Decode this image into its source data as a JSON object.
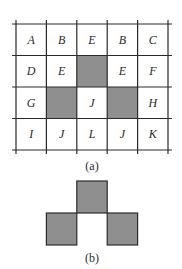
{
  "figure_a": {
    "caption": "(a)",
    "columns": 5,
    "rows": 4,
    "grid_x": [
      16,
      46.4,
      76.8,
      107.2,
      137.6,
      168
    ],
    "grid_y": [
      24,
      55.5,
      87,
      118.5,
      150
    ],
    "cells": [
      [
        "A",
        "B",
        "E",
        "B",
        "C"
      ],
      [
        "D",
        "E",
        "",
        "E",
        "F"
      ],
      [
        "G",
        "",
        "J",
        "",
        "H"
      ],
      [
        "I",
        "J",
        "L",
        "J",
        "K"
      ]
    ],
    "shaded_cells": [
      {
        "row": 1,
        "col": 2
      },
      {
        "row": 2,
        "col": 1
      },
      {
        "row": 2,
        "col": 3
      }
    ]
  },
  "figure_b": {
    "caption": "(b)",
    "squares": [
      {
        "x": 76.8,
        "y": 181,
        "w": 30.4,
        "h": 32
      },
      {
        "x": 46.4,
        "y": 213,
        "w": 30.4,
        "h": 32
      },
      {
        "x": 107.2,
        "y": 213,
        "w": 30.4,
        "h": 32
      }
    ]
  },
  "colors": {
    "line": "#2a2a2a",
    "shade": "#8f8f8f",
    "background": "#ffffff"
  }
}
